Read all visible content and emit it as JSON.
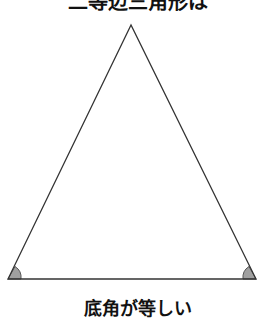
{
  "title": "二等辺三角形は",
  "caption": "底角が等しい",
  "diagram": {
    "shape": "isosceles-triangle",
    "apex": [
      131,
      25
    ],
    "base_left": [
      8,
      279
    ],
    "base_right": [
      256,
      279
    ],
    "marked_angles": [
      "base-left-angle",
      "base-right-angle"
    ],
    "angle_fill": "#a0a0a0",
    "stroke": "#333333"
  }
}
